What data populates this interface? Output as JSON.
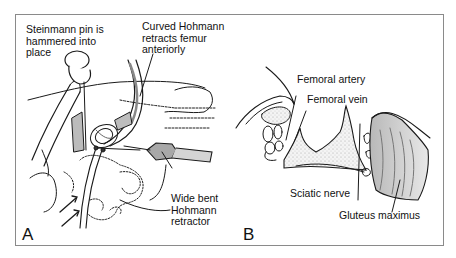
{
  "figure": {
    "panels": [
      {
        "id": "A",
        "letter": "A",
        "labels": {
          "steinmann_pin": "Steinmann pin is\nhammered into\nplace",
          "curved_hohmann": "Curved Hohmann\nretracts femur\nanteriorly",
          "wide_bent_hohmann": "Wide bent\nHohmann\nretractor"
        }
      },
      {
        "id": "B",
        "letter": "B",
        "labels": {
          "femoral_artery": "Femoral artery",
          "femoral_vein": "Femoral vein",
          "sciatic_nerve": "Sciatic nerve",
          "gluteus_maximus": "Gluteus maximus"
        }
      }
    ],
    "colors": {
      "line": "#1a1a1a",
      "frame": "#8a8a8a",
      "retractor_fill": "#a8a8a8",
      "muscle_fill": "#c4c4c4",
      "bone_stipple": "#e6e6e6"
    }
  }
}
